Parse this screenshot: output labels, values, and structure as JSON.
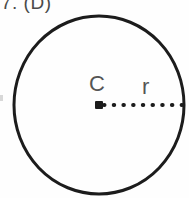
{
  "figure": {
    "question_label": "7. (D)",
    "background_color": "#fefefe",
    "ink_color": "#1c1c1c",
    "label_color": "#555555"
  },
  "diagram": {
    "type": "circle-with-radius",
    "circle": {
      "center_x": 99,
      "center_y": 105,
      "radius_x": 85,
      "radius_y": 89,
      "stroke_width": 3,
      "stroke_color": "#1c1c1c",
      "fill": "none"
    },
    "center_point": {
      "label": "C",
      "x": 99,
      "y": 105
    },
    "radius_segment": {
      "label": "r",
      "style": "dotted",
      "from_x": 99,
      "from_y": 105,
      "to_x": 181,
      "to_y": 105,
      "dot_count": 9,
      "dot_spacing": 10,
      "dot_size": 4,
      "color": "#1c1c1c"
    }
  }
}
